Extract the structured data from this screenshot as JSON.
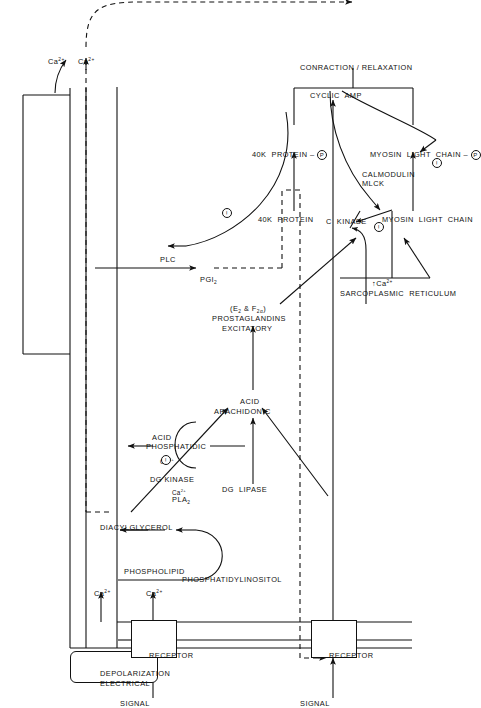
{
  "figure": {
    "type": "biochemical-signaling-pathway-diagram",
    "orientation": "rotated-90-counterclockwise",
    "background_color": "#ffffff",
    "line_color": "#111111"
  },
  "boxes": {
    "receptor_top": "RECEPTOR",
    "receptor_bottom": "RECEPTOR",
    "electrical_depolarization_line1": "ELECTRICAL",
    "electrical_depolarization_line2": "DEPOLARIZATION"
  },
  "inputs": {
    "signal_top": "SIGNAL",
    "signal_bottom": "SIGNAL"
  },
  "species": {
    "ca_membrane_upper": "Ca2+",
    "ca_membrane_lower": "Ca2+",
    "ca_receptor": "Ca2+",
    "ca_depolarization": "Ca2+",
    "phosphatidylinositol": "PHOSPHATIDYLINOSITOL",
    "diacylglycerol": "DIACYLGLYCEROL",
    "phosphatidic_acid_line1": "PHOSPHATIDIC",
    "phosphatidic_acid_line2": "ACID",
    "phospholipid": "PHOSPHOLIPID",
    "arachidonic_acid_line1": "ARACHIDONIC",
    "arachidonic_acid_line2": "ACID",
    "excitatory_prostaglandins_line1": "EXCITATORY",
    "excitatory_prostaglandins_line2": "PROSTAGLANDINS",
    "excitatory_prostaglandins_line3": "(E2 & F2a)",
    "pgi2": "PGI2",
    "cyclic_amp": "CYCLIC  AMP",
    "sarcoplasmic_reticulum": "SARCOPLASMIC  RETICULUM",
    "sr_calcium": "Ca2+",
    "protein_40k": "40K  PROTEIN",
    "protein_40k_phospho": "40K  PROTEIN -",
    "myosin_light_chain": "MYOSIN  LIGHT  CHAIN",
    "myosin_light_chain_phospho": "MYOSIN  LIGHT  CHAIN -",
    "contraction_relaxation": "CONRACTION / RELAXATION"
  },
  "enzymes": {
    "plc": "PLC",
    "dg_kinase": "DG KINASE",
    "dg_lipase": "DG  LIPASE",
    "pla2_line1": "PLA2",
    "pla2_line2": "Ca2+",
    "dg_kinase_cofactor": "Ca2+",
    "c_kinase": "C  KINASE",
    "mlck_line1": "MLCK",
    "mlck_line2": "CALMODULIN"
  },
  "symbols": {
    "minus": "−",
    "phosphate": "P",
    "up_arrow": "↑",
    "plus_minus_dg_kinase": "−",
    "plc_inhibition": "−",
    "sr_inhibition": "−",
    "mlc_inhibition": "−"
  },
  "legend_note": {
    "superscript_charge": "2+",
    "prostaglandin_subscripts": [
      "2",
      "2a"
    ]
  }
}
